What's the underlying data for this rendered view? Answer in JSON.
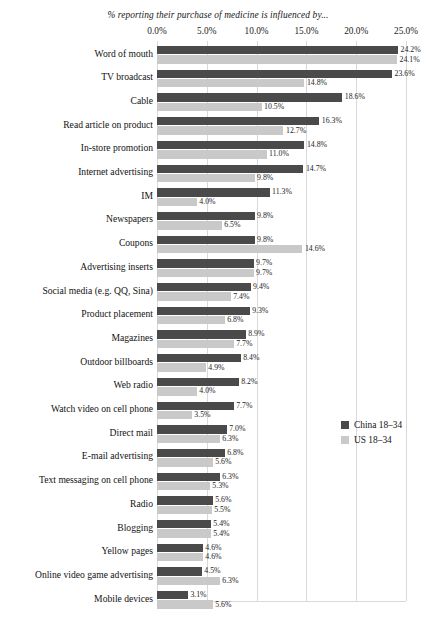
{
  "chart_data": {
    "type": "bar",
    "orientation": "horizontal",
    "title": "% reporting their purchase of medicine is influenced by...",
    "xlabel": "",
    "ylabel": "",
    "xlim": [
      0,
      25
    ],
    "grid": true,
    "legend_position": "right",
    "tick_labels": [
      "0.0%",
      "5.0%",
      "10.0%",
      "15.0%",
      "20.0%",
      "25.0%"
    ],
    "tick_values": [
      0,
      5,
      10,
      15,
      20,
      25
    ],
    "colors": {
      "china": "#4a4a4a",
      "us": "#c9c9c9",
      "gridline": "#d9d9d9",
      "background": "#ffffff",
      "text": "#1a1a1a"
    },
    "categories": [
      "Word of mouth",
      "TV broadcast",
      "Cable",
      "Read article on product",
      "In-store promotion",
      "Internet advertising",
      "IM",
      "Newspapers",
      "Coupons",
      "Advertising inserts",
      "Social media (e.g. QQ, Sina)",
      "Product placement",
      "Magazines",
      "Outdoor billboards",
      "Web radio",
      "Watch video on cell phone",
      "Direct mail",
      "E-mail advertising",
      "Text messaging on cell phone",
      "Radio",
      "Blogging",
      "Yellow pages",
      "Online video game advertising",
      "Mobile devices"
    ],
    "series": [
      {
        "name": "China 18–34",
        "color": "#4a4a4a",
        "values": [
          24.2,
          23.6,
          18.6,
          16.3,
          14.8,
          14.7,
          11.3,
          9.8,
          9.8,
          9.7,
          9.4,
          9.3,
          8.9,
          8.4,
          8.2,
          7.7,
          7.0,
          6.8,
          6.3,
          5.6,
          5.4,
          4.6,
          4.5,
          3.1
        ],
        "labels": [
          "24.2%",
          "23.6%",
          "18.6%",
          "16.3%",
          "14.8%",
          "14.7%",
          "11.3%",
          "9.8%",
          "9.8%",
          "9.7%",
          "9.4%",
          "9.3%",
          "8.9%",
          "8.4%",
          "8.2%",
          "7.7%",
          "7.0%",
          "6.8%",
          "6.3%",
          "5.6%",
          "5.4%",
          "4.6%",
          "4.5%",
          "3.1%"
        ]
      },
      {
        "name": "US 18–34",
        "color": "#c9c9c9",
        "values": [
          24.1,
          14.8,
          10.5,
          12.7,
          11.0,
          9.8,
          4.0,
          6.5,
          14.6,
          9.7,
          7.4,
          6.8,
          7.7,
          4.9,
          4.0,
          3.5,
          6.3,
          5.6,
          5.3,
          5.5,
          5.4,
          4.6,
          6.3,
          5.6
        ],
        "labels": [
          "24.1%",
          "14.8%",
          "10.5%",
          "12.7%",
          "11.0%",
          "9.8%",
          "4.0%",
          "6.5%",
          "14.6%",
          "9.7%",
          "7.4%",
          "6.8%",
          "7.7%",
          "4.9%",
          "4.0%",
          "3.5%",
          "6.3%",
          "5.6%",
          "5.3%",
          "5.5%",
          "5.4%",
          "4.6%",
          "6.3%",
          "5.6%"
        ]
      }
    ]
  }
}
